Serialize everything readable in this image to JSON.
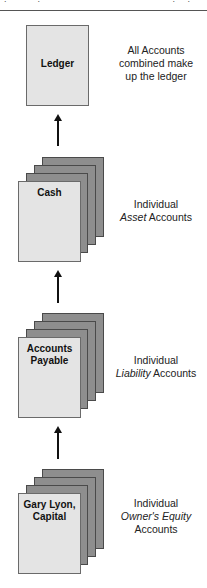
{
  "header": {
    "clipped_text": "·:·  ·  ·  ·  :·  ·  ·  ·  ·  ·  ·  ·  ·  ·  ·  ·  ·  ·  ·  ·  ·  ·:·  ·:·"
  },
  "levels": [
    {
      "id": "ledger",
      "card_label": "Ledger",
      "stacked": false,
      "desc_line1": "All Accounts",
      "desc_line2": "combined make",
      "desc_line3": "up the ledger"
    },
    {
      "id": "asset",
      "card_label": "Cash",
      "stacked": true,
      "desc_line1": "Individual",
      "desc_italic": "Asset",
      "desc_rest": " Accounts"
    },
    {
      "id": "liability",
      "card_label_line1": "Accounts",
      "card_label_line2": "Payable",
      "stacked": true,
      "desc_line1": "Individual",
      "desc_italic": "Liability",
      "desc_rest": " Accounts"
    },
    {
      "id": "equity",
      "card_label_line1": "Gary Lyon,",
      "card_label_line2": "Capital",
      "stacked": true,
      "desc_line1": "Individual",
      "desc_italic": "Owner's Equity",
      "desc_line3": "Accounts"
    }
  ],
  "colors": {
    "front_card": "#e4e4e4",
    "back_card": "#8e8e8e",
    "arrow": "#111111"
  }
}
